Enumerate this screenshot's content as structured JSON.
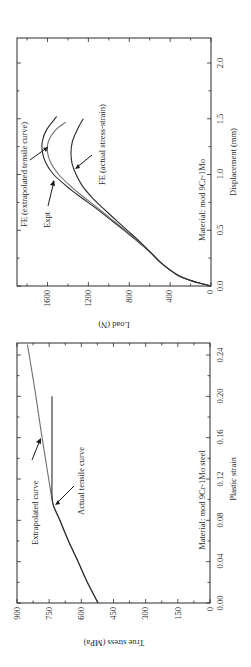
{
  "figure": {
    "orientation": "rotated-90-ccw",
    "background": "#ffffff",
    "ink_color": "#2a2a2a",
    "curve_colors": {
      "dark": "#2b2b2b",
      "gray": "#6e6e6e"
    }
  },
  "panels": {
    "top": {
      "x_axis": {
        "label": "Displacement (mm)",
        "ticks": [
          "0.0",
          "0.5",
          "1.0",
          "1.5",
          "2.0"
        ]
      },
      "y_axis": {
        "label": "Load (N)",
        "ticks": [
          "0",
          "400",
          "800",
          "1200",
          "1600"
        ]
      },
      "material_note": "Material: mod 9Cr-1Mo",
      "annotations": {
        "fe_extrapolated": "FE (extrapolated tensile curve)",
        "expt": "Expt",
        "fe_actual": "FE (actual stress-strain)"
      }
    },
    "bottom": {
      "x_axis": {
        "label": "Plastic strain",
        "ticks": [
          "0.00",
          "0.04",
          "0.08",
          "0.12",
          "0.16",
          "0.20",
          "0.24"
        ]
      },
      "y_axis": {
        "label": "True stress (MPa)",
        "ticks": [
          "0",
          "150",
          "300",
          "450",
          "600",
          "750",
          "900"
        ]
      },
      "material_note": "Material: mod 9Cr-1Mo steel",
      "annotations": {
        "extrapolated": "Extrapolated curve",
        "actual": "Actual tensile curve"
      }
    }
  },
  "chart_data": [
    {
      "type": "line",
      "title": "",
      "xlabel": "Displacement (mm)",
      "ylabel": "Load (N)",
      "xlim": [
        0,
        2.22
      ],
      "ylim": [
        0,
        1900
      ],
      "x_ticks": [
        0.0,
        0.5,
        1.0,
        1.5,
        2.0
      ],
      "y_ticks": [
        0,
        400,
        800,
        1200,
        1600
      ],
      "grid": false,
      "legend": "none (inline annotations with arrows)",
      "annotation": "Material: mod 9Cr-1Mo",
      "series": [
        {
          "name": "FE (extrapolated tensile curve)",
          "color": "#2b2b2b",
          "x": [
            0.0,
            0.05,
            0.1,
            0.2,
            0.3,
            0.4,
            0.5,
            0.6,
            0.7,
            0.8,
            0.9,
            1.0,
            1.1,
            1.2,
            1.3,
            1.4,
            1.52
          ],
          "y": [
            0,
            200,
            330,
            480,
            590,
            720,
            850,
            990,
            1130,
            1280,
            1420,
            1540,
            1615,
            1650,
            1650,
            1610,
            1510
          ]
        },
        {
          "name": "Expt",
          "color": "#6e6e6e",
          "x": [
            0.0,
            0.05,
            0.1,
            0.2,
            0.3,
            0.4,
            0.5,
            0.6,
            0.7,
            0.8,
            0.9,
            1.0,
            1.1,
            1.2,
            1.3,
            1.4,
            1.47
          ],
          "y": [
            0,
            200,
            330,
            480,
            590,
            715,
            840,
            975,
            1110,
            1250,
            1380,
            1490,
            1565,
            1600,
            1590,
            1520,
            1420
          ]
        },
        {
          "name": "FE (actual stress-strain)",
          "color": "#2b2b2b",
          "x": [
            0.0,
            0.05,
            0.1,
            0.2,
            0.3,
            0.4,
            0.5,
            0.6,
            0.7,
            0.8,
            0.9,
            1.0,
            1.1,
            1.2,
            1.3,
            1.4,
            1.5
          ],
          "y": [
            0,
            200,
            330,
            480,
            590,
            700,
            820,
            940,
            1060,
            1170,
            1260,
            1320,
            1360,
            1370,
            1355,
            1310,
            1250
          ]
        }
      ]
    },
    {
      "type": "line",
      "title": "",
      "xlabel": "Plastic strain",
      "ylabel": "True stress (MPa)",
      "xlim": [
        0,
        0.25
      ],
      "ylim": [
        0,
        900
      ],
      "x_ticks": [
        0.0,
        0.04,
        0.08,
        0.12,
        0.16,
        0.2,
        0.24
      ],
      "y_ticks": [
        0,
        150,
        300,
        450,
        600,
        750,
        900
      ],
      "grid": false,
      "legend": "none (inline annotations with arrows)",
      "annotation": "Material: mod 9Cr-1Mo steel",
      "series": [
        {
          "name": "Extrapolated curve",
          "color": "#6e6e6e",
          "x": [
            0.0,
            0.02,
            0.04,
            0.06,
            0.08,
            0.095,
            0.12,
            0.16,
            0.2,
            0.24,
            0.25
          ],
          "y": [
            522,
            572,
            615,
            660,
            700,
            731,
            752,
            783,
            812,
            843,
            852
          ]
        },
        {
          "name": "Actual tensile curve",
          "color": "#2b2b2b",
          "x": [
            0.0,
            0.02,
            0.04,
            0.06,
            0.08,
            0.095,
            0.105,
            0.12,
            0.16,
            0.2
          ],
          "y": [
            522,
            572,
            615,
            660,
            700,
            731,
            737,
            737,
            737,
            737
          ]
        }
      ]
    }
  ]
}
